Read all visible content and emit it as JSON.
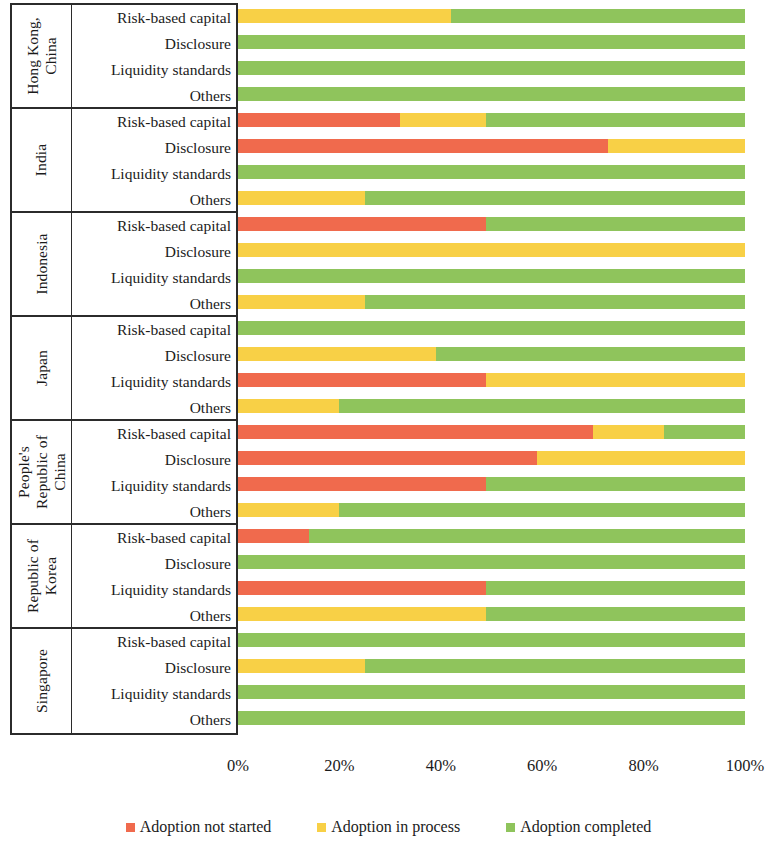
{
  "chart_data": {
    "type": "bar",
    "title": "",
    "subtitle": "",
    "xlabel": "",
    "ylabel": "",
    "orientation": "horizontal",
    "stacked": true,
    "stack_total": 100,
    "xlim": [
      0,
      100
    ],
    "grid": false,
    "legend_position": "bottom",
    "tick_labels": [
      "0%",
      "20%",
      "40%",
      "60%",
      "80%",
      "100%"
    ],
    "tick_values": [
      0,
      20,
      40,
      60,
      80,
      100
    ],
    "series": [
      {
        "name": "Adoption not started",
        "color": "#F06A4D"
      },
      {
        "name": "Adoption in process",
        "color": "#F8D046"
      },
      {
        "name": "Adoption completed",
        "color": "#8FC45C"
      }
    ],
    "measures": [
      "Risk-based capital",
      "Disclosure",
      "Liquidity standards",
      "Others"
    ],
    "groups": [
      {
        "country": "Hong Kong, China",
        "country_lines": [
          "Hong Kong,",
          "China"
        ],
        "rows": [
          {
            "measure": "Risk-based capital",
            "not_started": 0,
            "in_process": 42,
            "completed": 58
          },
          {
            "measure": "Disclosure",
            "not_started": 0,
            "in_process": 0,
            "completed": 100
          },
          {
            "measure": "Liquidity standards",
            "not_started": 0,
            "in_process": 0,
            "completed": 100
          },
          {
            "measure": "Others",
            "not_started": 0,
            "in_process": 0,
            "completed": 100
          }
        ]
      },
      {
        "country": "India",
        "country_lines": [
          "India"
        ],
        "rows": [
          {
            "measure": "Risk-based capital",
            "not_started": 32,
            "in_process": 17,
            "completed": 51
          },
          {
            "measure": "Disclosure",
            "not_started": 73,
            "in_process": 27,
            "completed": 0
          },
          {
            "measure": "Liquidity standards",
            "not_started": 0,
            "in_process": 0,
            "completed": 100
          },
          {
            "measure": "Others",
            "not_started": 0,
            "in_process": 25,
            "completed": 75
          }
        ]
      },
      {
        "country": "Indonesia",
        "country_lines": [
          "Indonesia"
        ],
        "rows": [
          {
            "measure": "Risk-based capital",
            "not_started": 49,
            "in_process": 0,
            "completed": 51
          },
          {
            "measure": "Disclosure",
            "not_started": 0,
            "in_process": 100,
            "completed": 0
          },
          {
            "measure": "Liquidity standards",
            "not_started": 0,
            "in_process": 0,
            "completed": 100
          },
          {
            "measure": "Others",
            "not_started": 0,
            "in_process": 25,
            "completed": 75
          }
        ]
      },
      {
        "country": "Japan",
        "country_lines": [
          "Japan"
        ],
        "rows": [
          {
            "measure": "Risk-based capital",
            "not_started": 0,
            "in_process": 0,
            "completed": 100
          },
          {
            "measure": "Disclosure",
            "not_started": 0,
            "in_process": 39,
            "completed": 61
          },
          {
            "measure": "Liquidity standards",
            "not_started": 49,
            "in_process": 51,
            "completed": 0
          },
          {
            "measure": "Others",
            "not_started": 0,
            "in_process": 20,
            "completed": 80
          }
        ]
      },
      {
        "country": "People's Republic of China",
        "country_lines": [
          "People's",
          "Republic of",
          "China"
        ],
        "rows": [
          {
            "measure": "Risk-based capital",
            "not_started": 70,
            "in_process": 14,
            "completed": 16
          },
          {
            "measure": "Disclosure",
            "not_started": 59,
            "in_process": 41,
            "completed": 0
          },
          {
            "measure": "Liquidity standards",
            "not_started": 49,
            "in_process": 0,
            "completed": 51
          },
          {
            "measure": "Others",
            "not_started": 0,
            "in_process": 20,
            "completed": 80
          }
        ]
      },
      {
        "country": "Republic of Korea",
        "country_lines": [
          "Republic of",
          "Korea"
        ],
        "rows": [
          {
            "measure": "Risk-based capital",
            "not_started": 14,
            "in_process": 0,
            "completed": 86
          },
          {
            "measure": "Disclosure",
            "not_started": 0,
            "in_process": 0,
            "completed": 100
          },
          {
            "measure": "Liquidity standards",
            "not_started": 49,
            "in_process": 0,
            "completed": 51
          },
          {
            "measure": "Others",
            "not_started": 0,
            "in_process": 49,
            "completed": 51
          }
        ]
      },
      {
        "country": "Singapore",
        "country_lines": [
          "Singapore"
        ],
        "rows": [
          {
            "measure": "Risk-based capital",
            "not_started": 0,
            "in_process": 0,
            "completed": 100
          },
          {
            "measure": "Disclosure",
            "not_started": 0,
            "in_process": 25,
            "completed": 75
          },
          {
            "measure": "Liquidity standards",
            "not_started": 0,
            "in_process": 0,
            "completed": 100
          },
          {
            "measure": "Others",
            "not_started": 0,
            "in_process": 0,
            "completed": 100
          }
        ]
      }
    ]
  },
  "colors": {
    "not_started": "#F06A4D",
    "in_process": "#F8D046",
    "completed": "#8FC45C",
    "rule": "#2b2b2b",
    "text": "#1b1b1b",
    "background": "#ffffff"
  },
  "legend": {
    "items": [
      {
        "label": "Adoption not started",
        "color": "#F06A4D"
      },
      {
        "label": "Adoption in process",
        "color": "#F8D046"
      },
      {
        "label": "Adoption completed",
        "color": "#8FC45C"
      }
    ]
  },
  "axis": {
    "ticks": [
      {
        "label": "0%",
        "value": 0
      },
      {
        "label": "20%",
        "value": 20
      },
      {
        "label": "40%",
        "value": 40
      },
      {
        "label": "60%",
        "value": 60
      },
      {
        "label": "80%",
        "value": 80
      },
      {
        "label": "100%",
        "value": 100
      }
    ]
  }
}
